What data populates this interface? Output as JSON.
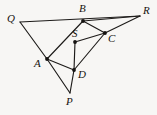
{
  "figure": {
    "kind": "geometry-diagram",
    "caption": "",
    "background_color": "#f7f6f4",
    "stroke_color": "#1d1b19",
    "label_color": "#16130f",
    "width": 157,
    "height": 115,
    "points": [
      {
        "id": "Q",
        "label": "Q",
        "x": 20,
        "y": 22,
        "label_x": 7,
        "label_y": 13,
        "dot": false
      },
      {
        "id": "B",
        "label": "B",
        "x": 83,
        "y": 21,
        "label_x": 79,
        "label_y": 3,
        "dot": true
      },
      {
        "id": "R",
        "label": "R",
        "x": 140,
        "y": 16,
        "label_x": 143,
        "label_y": 5,
        "dot": false
      },
      {
        "id": "S",
        "label": "S",
        "x": 75,
        "y": 42,
        "label_x": 72,
        "label_y": 28,
        "dot": true
      },
      {
        "id": "C",
        "label": "C",
        "x": 105,
        "y": 33,
        "label_x": 108,
        "label_y": 33,
        "dot": true
      },
      {
        "id": "A",
        "label": "A",
        "x": 47,
        "y": 59,
        "label_x": 34,
        "label_y": 58,
        "dot": true
      },
      {
        "id": "D",
        "label": "D",
        "x": 74,
        "y": 70,
        "label_x": 78,
        "label_y": 69,
        "dot": true
      },
      {
        "id": "P",
        "label": "P",
        "x": 70,
        "y": 93,
        "label_x": 66,
        "label_y": 96,
        "dot": false
      }
    ],
    "edges": [
      {
        "id": "QR",
        "from": "Q",
        "to": "R",
        "note": "top line through B"
      },
      {
        "id": "QA",
        "from": "Q",
        "to": "A"
      },
      {
        "id": "AB",
        "from": "A",
        "to": "B"
      },
      {
        "id": "BR",
        "from": "B",
        "to": "R"
      },
      {
        "id": "BC",
        "from": "B",
        "to": "C"
      },
      {
        "id": "CR",
        "from": "C",
        "to": "R"
      },
      {
        "id": "SC",
        "from": "S",
        "to": "C"
      },
      {
        "id": "SD",
        "from": "S",
        "to": "D"
      },
      {
        "id": "AD",
        "from": "A",
        "to": "D"
      },
      {
        "id": "DC",
        "from": "D",
        "to": "C"
      },
      {
        "id": "AP",
        "from": "A",
        "to": "P"
      },
      {
        "id": "DP",
        "from": "D",
        "to": "P"
      }
    ]
  }
}
